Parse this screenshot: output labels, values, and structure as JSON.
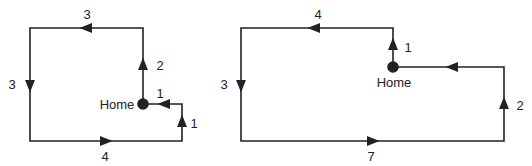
{
  "diagrams": [
    {
      "name": "path-a",
      "home_label": "Home",
      "segments": [
        {
          "label": "1",
          "direction": "up"
        },
        {
          "label": "1",
          "direction": "left"
        },
        {
          "label": "2",
          "direction": "up"
        },
        {
          "label": "3",
          "direction": "left"
        },
        {
          "label": "3",
          "direction": "down"
        },
        {
          "label": "4",
          "direction": "right"
        }
      ]
    },
    {
      "name": "path-b",
      "home_label": "Home",
      "segments": [
        {
          "label": "1",
          "direction": "up"
        },
        {
          "label": "4",
          "direction": "left"
        },
        {
          "label": "3",
          "direction": "down"
        },
        {
          "label": "7",
          "direction": "right"
        },
        {
          "label": "2",
          "direction": "up"
        }
      ]
    }
  ],
  "colors": {
    "line": "#222222",
    "background": "#ffffff"
  }
}
